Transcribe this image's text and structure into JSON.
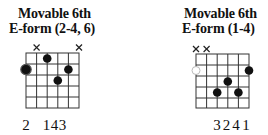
{
  "chords": [
    {
      "title_line1": "Movable 6th",
      "title_line2": "E-form (2-4, 6)",
      "muted_strings": [
        5,
        1
      ],
      "root": {
        "string": 6,
        "fret": 2,
        "style": "ringed-filled"
      },
      "dots": [
        {
          "string": 6,
          "fret": 2
        },
        {
          "string": 4,
          "fret": 1
        },
        {
          "string": 3,
          "fret": 3
        },
        {
          "string": 2,
          "fret": 2
        }
      ],
      "fingering_text": "2 143",
      "fingers": [
        {
          "string": 6,
          "finger": "2"
        },
        {
          "string": 4,
          "finger": "1"
        },
        {
          "string": 3,
          "finger": "4"
        },
        {
          "string": 2,
          "finger": "3"
        }
      ]
    },
    {
      "title_line1": "Movable 6th",
      "title_line2": "E-form (1-4)",
      "muted_strings": [
        6,
        5
      ],
      "root": {
        "string": 6,
        "fret": 2,
        "style": "hollow"
      },
      "dots": [
        {
          "string": 1,
          "fret": 2
        },
        {
          "string": 3,
          "fret": 3
        },
        {
          "string": 4,
          "fret": 4
        },
        {
          "string": 2,
          "fret": 4
        }
      ],
      "fingering_text": "3241",
      "fingers": [
        {
          "string": 4,
          "finger": "3"
        },
        {
          "string": 3,
          "finger": "2"
        },
        {
          "string": 2,
          "finger": "4"
        },
        {
          "string": 1,
          "finger": "1"
        }
      ]
    }
  ],
  "colors": {
    "ink": "#111111",
    "grid": "#333333",
    "background": "#ffffff"
  }
}
